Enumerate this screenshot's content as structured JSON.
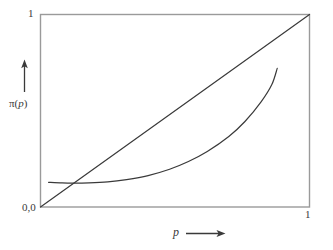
{
  "figure": {
    "title": "",
    "background_color": "#ffffff",
    "frame_color": "#9a9a9a",
    "line_color": "#3a3a3a"
  },
  "axes": {
    "y_top_tick": "1",
    "origin_tick": "0,0",
    "x_right_tick": "1",
    "y_axis_label_pi": "π(",
    "y_axis_label_var": "p",
    "y_axis_label_close": ")",
    "x_axis_label": "p",
    "y_arrow_icon": "up-arrow",
    "x_arrow_icon": "right-arrow"
  },
  "chart_data": {
    "type": "line",
    "title": "",
    "xlabel": "p",
    "ylabel": "π(p)",
    "xlim": [
      0,
      1
    ],
    "ylim": [
      0,
      1
    ],
    "xticks": [
      0,
      1
    ],
    "xticklabels": [
      "0,0",
      "1"
    ],
    "yticks": [
      0,
      1
    ],
    "yticklabels": [
      "0,0",
      "1"
    ],
    "grid": false,
    "legend": false,
    "legend_position": "none",
    "annotations": [],
    "series": [
      {
        "name": "identity-diagonal",
        "kind": "reference-line",
        "color": "#3a3a3a",
        "x": [
          0.0,
          1.0
        ],
        "values": [
          0.0,
          1.0
        ]
      },
      {
        "name": "probability-weighting-function",
        "kind": "curve",
        "color": "#3a3a3a",
        "x": [
          0.03,
          0.08,
          0.12,
          0.18,
          0.25,
          0.32,
          0.4,
          0.48,
          0.55,
          0.62,
          0.7,
          0.76,
          0.82,
          0.86,
          0.88
        ],
        "values": [
          0.128,
          0.125,
          0.124,
          0.125,
          0.13,
          0.142,
          0.163,
          0.196,
          0.236,
          0.288,
          0.366,
          0.444,
          0.546,
          0.636,
          0.72
        ]
      }
    ]
  }
}
